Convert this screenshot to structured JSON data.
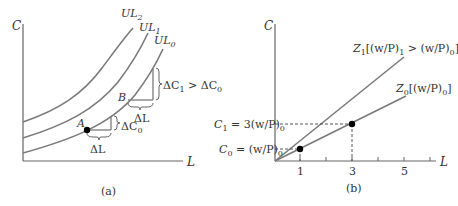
{
  "panel_a": {
    "caption": "(a)",
    "y_axis_label": "C",
    "x_axis_label": "L",
    "curves": [
      {
        "name": "UL",
        "sub": "0"
      },
      {
        "name": "UL",
        "sub": "1"
      },
      {
        "name": "UL",
        "sub": "2"
      }
    ],
    "point_a": "A",
    "point_b": "B",
    "delta_l_a": "ΔL",
    "delta_l_b": "ΔL",
    "delta_c0": {
      "main": "ΔC",
      "sub": "0"
    },
    "delta_c1_gt": {
      "main1": "ΔC",
      "sub1": "1",
      "op": " > ",
      "main2": "ΔC",
      "sub2": "0"
    }
  },
  "panel_b": {
    "caption": "(b)",
    "y_axis_label": "C",
    "x_axis_label": "L",
    "x_ticks": [
      "1",
      "3",
      "5"
    ],
    "z1_label": {
      "z": "Z",
      "sub": "1",
      "rest1": "[(w/P)",
      "s1": "1",
      "mid": " > (w/P)",
      "s2": "0",
      "end": "]"
    },
    "z0_label": {
      "z": "Z",
      "sub": "0",
      "rest1": "[(w/P)",
      "s1": "0",
      "end": "]"
    },
    "c1_label": {
      "c": "C",
      "sub": "1",
      "rest": " = 3(w/P)",
      "s": "0"
    },
    "c0_label": {
      "c": "C",
      "sub": "0",
      "rest": " = (w/P)",
      "s": "0"
    }
  },
  "colors": {
    "curve": "#7a7a7a",
    "axis": "#555555",
    "point": "#000000"
  }
}
